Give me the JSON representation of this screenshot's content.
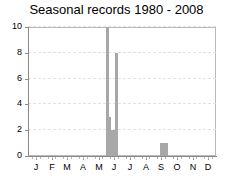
{
  "chart_data": {
    "type": "bar",
    "title": "Seasonal records 1980 - 2008",
    "xlabel": "",
    "ylabel": "",
    "ylim": [
      0,
      10
    ],
    "yticks": [
      0,
      2,
      4,
      6,
      8,
      10
    ],
    "grid": true,
    "legend": false,
    "xaxis_type": "months",
    "categories": [
      "J",
      "F",
      "M",
      "A",
      "M",
      "J",
      "J",
      "A",
      "S",
      "O",
      "N",
      "D"
    ],
    "category_names": [
      "January",
      "February",
      "March",
      "April",
      "May",
      "June",
      "July",
      "August",
      "September",
      "October",
      "November",
      "December"
    ],
    "bar_color": "#a8a8a8",
    "points": [
      {
        "month_index": 4.55,
        "value": 10
      },
      {
        "month_index": 4.72,
        "value": 3
      },
      {
        "month_index": 4.86,
        "value": 2
      },
      {
        "month_index": 5.0,
        "value": 2
      },
      {
        "month_index": 5.12,
        "value": 8
      },
      {
        "month_index": 8.02,
        "value": 1
      },
      {
        "month_index": 8.18,
        "value": 1
      },
      {
        "month_index": 8.34,
        "value": 1
      }
    ],
    "values_by_category": {
      "J": 0,
      "F": 0,
      "M": 0,
      "A": 0,
      "M_may": 10,
      "J_jun": 8,
      "J_jul": 0,
      "A_aug": 1,
      "S": 1,
      "O": 0,
      "N": 0,
      "D": 0
    }
  },
  "axes": {
    "y_tick_labels": [
      "0",
      "2",
      "4",
      "6",
      "8",
      "10"
    ],
    "x_tick_labels": [
      "J",
      "F",
      "M",
      "A",
      "M",
      "J",
      "J",
      "A",
      "S",
      "O",
      "N",
      "D"
    ]
  },
  "colors": {
    "bar": "#a8a8a8",
    "frame": "#b9b9b9",
    "spine": "#8a8a8a",
    "grid": "#e2e2e2",
    "text": "#000000",
    "background": "#ffffff"
  }
}
